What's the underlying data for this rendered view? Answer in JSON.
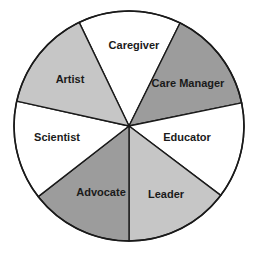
{
  "diagram": {
    "type": "segmented-circle",
    "center": [
      129,
      126
    ],
    "radius": 115,
    "outline_color": "#1a1a1a",
    "segments": [
      {
        "label": "Caregiver",
        "fill": "#ffffff",
        "start": [
          79,
          22
        ],
        "end": [
          180,
          23
        ],
        "label_pos": [
          134,
          46
        ]
      },
      {
        "label": "Care Manager",
        "fill": "#9c9c9c",
        "start": [
          180,
          23
        ],
        "end": [
          241,
          103
        ],
        "label_pos": [
          188,
          84
        ]
      },
      {
        "label": "Educator",
        "fill": "#ffffff",
        "start": [
          241,
          103
        ],
        "end": [
          219,
          194
        ],
        "label_pos": [
          187,
          138
        ]
      },
      {
        "label": "Leader",
        "fill": "#c6c6c6",
        "start": [
          219,
          194
        ],
        "end": [
          129,
          241
        ],
        "label_pos": [
          166,
          195
        ]
      },
      {
        "label": "Advocate",
        "fill": "#9c9c9c",
        "start": [
          129,
          241
        ],
        "end": [
          39,
          196
        ],
        "label_pos": [
          101,
          193
        ]
      },
      {
        "label": "Scientist",
        "fill": "#ffffff",
        "start": [
          39,
          196
        ],
        "end": [
          16,
          101
        ],
        "label_pos": [
          57,
          138
        ]
      },
      {
        "label": "Artist",
        "fill": "#c6c6c6",
        "start": [
          16,
          101
        ],
        "end": [
          79,
          22
        ],
        "label_pos": [
          70,
          80
        ]
      }
    ]
  }
}
